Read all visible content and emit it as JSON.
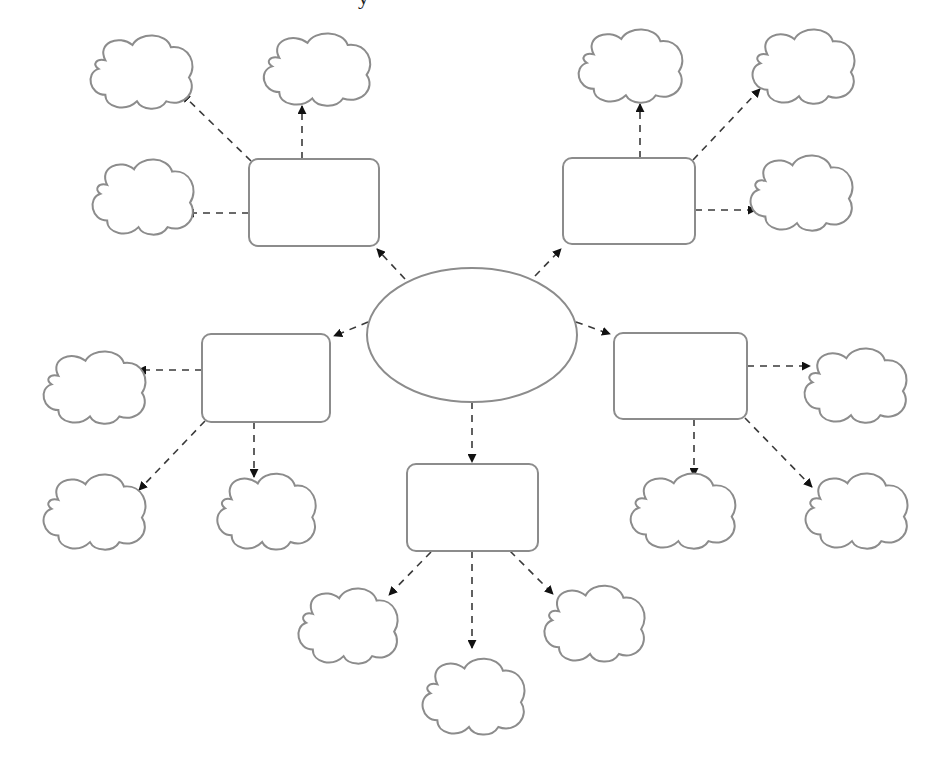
{
  "diagram": {
    "type": "spider-map",
    "top_cut_text": "y",
    "colors": {
      "background": "#ffffff",
      "outline": "#8c8c8c",
      "connector": "#3a3a3a",
      "arrowhead": "#111111"
    },
    "center": {
      "shape": "ellipse",
      "cx": 472,
      "cy": 335,
      "rx": 105,
      "ry": 67,
      "label": ""
    },
    "boxes": [
      {
        "id": "box-top-left",
        "x": 249,
        "y": 159,
        "w": 130,
        "h": 87,
        "label": ""
      },
      {
        "id": "box-top-right",
        "x": 563,
        "y": 158,
        "w": 132,
        "h": 86,
        "label": ""
      },
      {
        "id": "box-middle-left",
        "x": 202,
        "y": 334,
        "w": 128,
        "h": 88,
        "label": ""
      },
      {
        "id": "box-middle-right",
        "x": 614,
        "y": 333,
        "w": 133,
        "h": 86,
        "label": ""
      },
      {
        "id": "box-bottom",
        "x": 407,
        "y": 464,
        "w": 131,
        "h": 87,
        "label": ""
      }
    ],
    "clouds": [
      {
        "id": "cloud-tl-1",
        "x": 85,
        "y": 32,
        "w": 113,
        "h": 78,
        "label": ""
      },
      {
        "id": "cloud-tl-2",
        "x": 258,
        "y": 30,
        "w": 118,
        "h": 77,
        "label": ""
      },
      {
        "id": "cloud-tl-3",
        "x": 87,
        "y": 156,
        "w": 112,
        "h": 80,
        "label": ""
      },
      {
        "id": "cloud-tr-1",
        "x": 573,
        "y": 26,
        "w": 115,
        "h": 78,
        "label": ""
      },
      {
        "id": "cloud-tr-2",
        "x": 747,
        "y": 26,
        "w": 113,
        "h": 79,
        "label": ""
      },
      {
        "id": "cloud-tr-3",
        "x": 745,
        "y": 152,
        "w": 113,
        "h": 80,
        "label": ""
      },
      {
        "id": "cloud-ml-1",
        "x": 38,
        "y": 348,
        "w": 113,
        "h": 77,
        "label": ""
      },
      {
        "id": "cloud-ml-2",
        "x": 38,
        "y": 471,
        "w": 113,
        "h": 80,
        "label": ""
      },
      {
        "id": "cloud-ml-3",
        "x": 212,
        "y": 470,
        "w": 109,
        "h": 81,
        "label": ""
      },
      {
        "id": "cloud-mr-1",
        "x": 799,
        "y": 345,
        "w": 113,
        "h": 79,
        "label": ""
      },
      {
        "id": "cloud-mr-2",
        "x": 625,
        "y": 470,
        "w": 116,
        "h": 80,
        "label": ""
      },
      {
        "id": "cloud-mr-3",
        "x": 800,
        "y": 470,
        "w": 113,
        "h": 80,
        "label": ""
      },
      {
        "id": "cloud-b-1",
        "x": 293,
        "y": 585,
        "w": 110,
        "h": 80,
        "label": ""
      },
      {
        "id": "cloud-b-2",
        "x": 417,
        "y": 655,
        "w": 113,
        "h": 81,
        "label": ""
      },
      {
        "id": "cloud-b-3",
        "x": 539,
        "y": 582,
        "w": 111,
        "h": 81,
        "label": ""
      }
    ],
    "arrows": [
      {
        "from": "center",
        "to": "box-top-left",
        "x1": 405,
        "y1": 279,
        "x2": 377,
        "y2": 249
      },
      {
        "from": "center",
        "to": "box-top-right",
        "x1": 535,
        "y1": 276,
        "x2": 561,
        "y2": 249
      },
      {
        "from": "center",
        "to": "box-middle-left",
        "x1": 368,
        "y1": 322,
        "x2": 334,
        "y2": 336
      },
      {
        "from": "center",
        "to": "box-middle-right",
        "x1": 576,
        "y1": 322,
        "x2": 610,
        "y2": 334
      },
      {
        "from": "center",
        "to": "box-bottom",
        "x1": 472,
        "y1": 402,
        "x2": 472,
        "y2": 462
      },
      {
        "from": "box-top-left",
        "to": "cloud-tl-1",
        "x1": 251,
        "y1": 161,
        "x2": 182,
        "y2": 94
      },
      {
        "from": "box-top-left",
        "to": "cloud-tl-2",
        "x1": 302,
        "y1": 159,
        "x2": 302,
        "y2": 106
      },
      {
        "from": "box-top-left",
        "to": "cloud-tl-3",
        "x1": 249,
        "y1": 213,
        "x2": 186,
        "y2": 213
      },
      {
        "from": "box-top-right",
        "to": "cloud-tr-1",
        "x1": 640,
        "y1": 158,
        "x2": 640,
        "y2": 104
      },
      {
        "from": "box-top-right",
        "to": "cloud-tr-2",
        "x1": 693,
        "y1": 160,
        "x2": 760,
        "y2": 89
      },
      {
        "from": "box-top-right",
        "to": "cloud-tr-3",
        "x1": 695,
        "y1": 210,
        "x2": 756,
        "y2": 210
      },
      {
        "from": "box-middle-left",
        "to": "cloud-ml-1",
        "x1": 202,
        "y1": 370,
        "x2": 138,
        "y2": 370
      },
      {
        "from": "box-middle-left",
        "to": "cloud-ml-2",
        "x1": 205,
        "y1": 421,
        "x2": 139,
        "y2": 490
      },
      {
        "from": "box-middle-left",
        "to": "cloud-ml-3",
        "x1": 254,
        "y1": 422,
        "x2": 254,
        "y2": 477
      },
      {
        "from": "box-middle-right",
        "to": "cloud-mr-1",
        "x1": 747,
        "y1": 366,
        "x2": 810,
        "y2": 366
      },
      {
        "from": "box-middle-right",
        "to": "cloud-mr-2",
        "x1": 694,
        "y1": 419,
        "x2": 694,
        "y2": 476
      },
      {
        "from": "box-middle-right",
        "to": "cloud-mr-3",
        "x1": 745,
        "y1": 418,
        "x2": 812,
        "y2": 487
      },
      {
        "from": "box-bottom",
        "to": "cloud-b-1",
        "x1": 431,
        "y1": 552,
        "x2": 389,
        "y2": 595
      },
      {
        "from": "box-bottom",
        "to": "cloud-b-2",
        "x1": 472,
        "y1": 551,
        "x2": 472,
        "y2": 648
      },
      {
        "from": "box-bottom",
        "to": "cloud-b-3",
        "x1": 510,
        "y1": 551,
        "x2": 553,
        "y2": 594
      }
    ]
  }
}
